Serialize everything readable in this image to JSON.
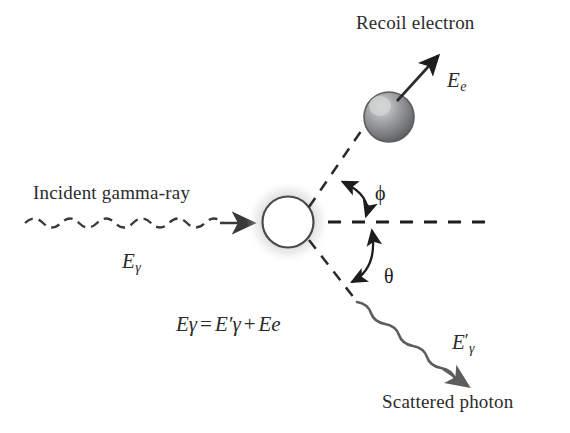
{
  "diagram": {
    "background_color": "#ffffff",
    "ink_color": "#2b2b2b",
    "labels": {
      "recoil_electron": "Recoil electron",
      "incident_gamma_ray": "Incident gamma-ray",
      "scattered_photon": "Scattered photon"
    },
    "symbols": {
      "electron_energy": "E",
      "electron_energy_sub": "e",
      "incident_energy": "E",
      "incident_energy_sub": "γ",
      "scattered_energy": "E",
      "scattered_energy_prime": "′",
      "scattered_energy_sub": "γ",
      "phi": "ϕ",
      "theta": "θ"
    },
    "equation": {
      "lhs": "E",
      "lhs_sub": "γ",
      "equals": "=",
      "rhs1": "E",
      "rhs1_prime": "′",
      "rhs1_sub": "γ",
      "plus": "+",
      "rhs2": "E",
      "rhs2_sub": "e"
    },
    "elements": {
      "target_atom": "target-atom",
      "recoil_electron_sphere": "recoil-electron-sphere",
      "incident_wave": "incident-gamma-wave",
      "scattered_wave": "scattered-photon-wave",
      "reference_axis": "horizontal-reference-axis",
      "phi_arc": "phi-angle-arc",
      "theta_arc": "theta-angle-arc"
    },
    "colors": {
      "electron_sphere_dark": "#6f7073",
      "electron_sphere_mid": "#8d8e90",
      "electron_sphere_light": "#c9cacb",
      "atom_fill": "#ffffff",
      "atom_outline": "#3a3a3a",
      "glow": "#bdbdbd",
      "arrow": "#1d1d1d",
      "scattered_arrow": "#5d5d5d"
    }
  }
}
